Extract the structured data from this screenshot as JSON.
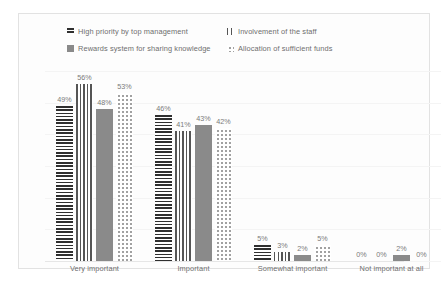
{
  "chart_data": {
    "type": "bar",
    "title": "",
    "subtitle": "",
    "xlabel": "",
    "ylabel": "",
    "ylim": [
      0,
      60
    ],
    "grid": true,
    "legend_position": "top",
    "value_suffix": "%",
    "categories": [
      "Very important",
      "Important",
      "Somewhat important",
      "Not important at all"
    ],
    "series": [
      {
        "name": "High priority by top management",
        "pattern": "horizontal-stripes",
        "color": "#2f2f2f",
        "values": [
          49,
          46,
          5,
          0
        ],
        "labels": [
          "49%",
          "46%",
          "5%",
          "0%"
        ]
      },
      {
        "name": "Involvement of the staff",
        "pattern": "vertical-stripes",
        "color": "#555555",
        "values": [
          56,
          41,
          3,
          0
        ],
        "labels": [
          "56%",
          "41%",
          "3%",
          "0%"
        ]
      },
      {
        "name": "Rewards system for sharing knowledge",
        "pattern": "solid-gray",
        "color": "#8a8a8a",
        "values": [
          48,
          43,
          2,
          2
        ],
        "labels": [
          "48%",
          "43%",
          "2%",
          "2%"
        ]
      },
      {
        "name": "Allocation of sufficient funds",
        "pattern": "dotted",
        "color": "#9a9a9a",
        "values": [
          53,
          42,
          5,
          0
        ],
        "labels": [
          "53%",
          "42%",
          "5%",
          "0%"
        ]
      }
    ]
  },
  "legend": {
    "items": [
      {
        "label": "High priority by top management"
      },
      {
        "label": "Involvement of the staff"
      },
      {
        "label": "Rewards system for sharing knowledge"
      },
      {
        "label": "Allocation of sufficient funds"
      }
    ]
  }
}
